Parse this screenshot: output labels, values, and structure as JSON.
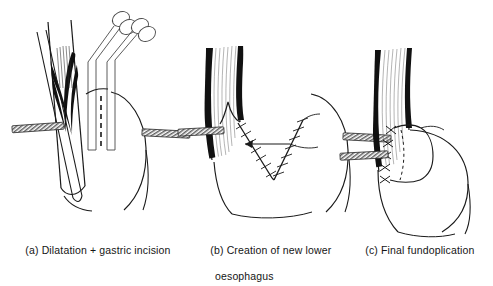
{
  "figure": {
    "type": "medical-surgical-illustration",
    "title_visible": false,
    "background_color": "#ffffff",
    "ink_color": "#1a1a1a",
    "panel_count": 3
  },
  "captions": {
    "a": "(a) Dilatation + gastric incision",
    "b_line1": "(b) Creation of new lower",
    "b_line2": "oesophagus",
    "c": "(c) Final fundoplication"
  },
  "panels": [
    {
      "id": "a",
      "label": "(a) Dilatation + gastric incision",
      "elements": [
        "oesophagus",
        "muscle-shading",
        "dilator-bougie",
        "stapler-instrument-1",
        "stapler-instrument-2",
        "dashed-incision-line",
        "diaphragm-band-left",
        "diaphragm-band-right",
        "stomach-fundus-outline"
      ]
    },
    {
      "id": "b",
      "label": "(b) Creation of new lower oesophagus",
      "elements": [
        "oesophagus",
        "muscle-striations",
        "v-shaped-staple-line-left",
        "v-shaped-staple-line-right",
        "lumen-arrow",
        "leader-line",
        "diaphragm-band-left",
        "diaphragm-band-right",
        "stomach-fundus-outline"
      ]
    },
    {
      "id": "c",
      "label": "(c) Final fundoplication",
      "elements": [
        "oesophagus",
        "muscle-striations",
        "fundal-wrap-outline",
        "dashed-hidden-edge",
        "suture-knots",
        "diaphragm-band-left",
        "stomach-fundus-outline"
      ]
    }
  ],
  "annotations": {
    "suture_knot_count_panel_c": 5,
    "stapler_handle_rings": 4,
    "instrument_count_panel_a": 2,
    "diaphragm_band_style": "diagonal-hatched"
  }
}
